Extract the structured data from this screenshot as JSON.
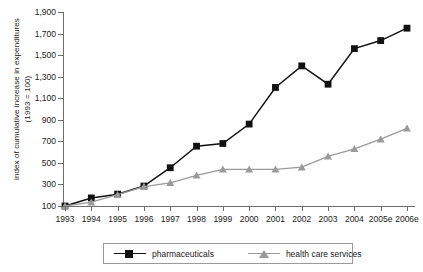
{
  "chart_data": {
    "type": "line",
    "title": "",
    "xlabel": "",
    "ylabel": "index of cumulative increase in expenditures (1993 = 100)",
    "x": [
      "1993",
      "1994",
      "1995",
      "1996",
      "1997",
      "1998",
      "1999",
      "2000",
      "2001",
      "2002",
      "2003",
      "2004",
      "2005e",
      "2006e"
    ],
    "ylim": [
      100,
      1900
    ],
    "yticks": [
      "100",
      "300",
      "500",
      "700",
      "900",
      "1,100",
      "1,300",
      "1,500",
      "1,700",
      "1,900"
    ],
    "ytick_values": [
      100,
      300,
      500,
      700,
      900,
      1100,
      1300,
      1500,
      1700,
      1900
    ],
    "grid": false,
    "legend_position": "bottom",
    "series": [
      {
        "name": "pharmaceuticals",
        "marker": "square",
        "color": "#111111",
        "values": [
          100,
          175,
          210,
          285,
          455,
          655,
          680,
          860,
          1200,
          1400,
          1230,
          1560,
          1635,
          1750
        ]
      },
      {
        "name": "health care services",
        "marker": "triangle",
        "color": "#9a9a9a",
        "values": [
          100,
          135,
          205,
          280,
          315,
          385,
          440,
          440,
          440,
          460,
          560,
          630,
          720,
          820
        ]
      }
    ]
  },
  "axis": {
    "y_title": "index of cumulative increase in expenditures (1993 = 100)"
  },
  "legend": {
    "items": [
      {
        "label": "pharmaceuticals",
        "marker": "square-marker-icon",
        "color": "#111111"
      },
      {
        "label": "health care services",
        "marker": "triangle-marker-icon",
        "color": "#9a9a9a"
      }
    ]
  },
  "colors": {
    "pharmaceuticals": "#111111",
    "health_care_services": "#9a9a9a",
    "axis": "#6e6e6e",
    "text": "#1a1a1a",
    "background": "#ffffff"
  }
}
